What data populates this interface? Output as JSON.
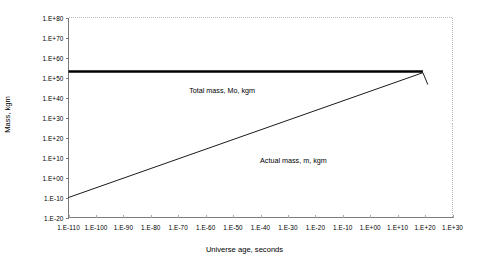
{
  "chart_data": {
    "type": "line",
    "title": "",
    "xlabel": "Universe age, seconds",
    "ylabel": "Mass, kgm",
    "xscale": "log",
    "yscale": "log",
    "xtick_labels": [
      "1.E-110",
      "1.E-100",
      "1.E-90",
      "1.E-80",
      "1.E-70",
      "1.E-60",
      "1.E-50",
      "1.E-40",
      "1.E-30",
      "1.E-20",
      "1.E-10",
      "1.E+00",
      "1.E+10",
      "1.E+20",
      "1.E+30"
    ],
    "xtick_exponents": [
      -110,
      -100,
      -90,
      -80,
      -70,
      -60,
      -50,
      -40,
      -30,
      -20,
      -10,
      0,
      10,
      20,
      30
    ],
    "ytick_labels": [
      "1.E+80",
      "1.E+70",
      "1.E+60",
      "1.E+50",
      "1.E+40",
      "1.E+30",
      "1.E+20",
      "1.E+10",
      "1.E+00",
      "1.E-10",
      "1.E-20"
    ],
    "ytick_exponents": [
      80,
      70,
      60,
      50,
      40,
      30,
      20,
      10,
      0,
      -10,
      -20
    ],
    "xlim_exponents": [
      -110,
      30
    ],
    "ylim_exponents": [
      -20,
      80
    ],
    "grid": false,
    "legend": "none",
    "plot_border": "dotted-light-gray",
    "series": [
      {
        "name": "Total mass, Mo, kgm",
        "style": "thick-solid-black",
        "color": "#000000",
        "points_exponents": [
          [
            -110,
            53
          ],
          [
            19.2,
            53
          ]
        ],
        "annotation": {
          "text": "Total mass, Mo, kgm",
          "x_exponent": -54,
          "y_exponent": 46
        }
      },
      {
        "name": "Actual mass, m, kgm",
        "style": "thin-solid-black",
        "color": "#000000",
        "points_exponents": [
          [
            -110,
            -10
          ],
          [
            19.2,
            52.4
          ],
          [
            21.0,
            46.5
          ]
        ],
        "annotation": {
          "text": "Actual mass, m, kgm",
          "x_exponent": -28,
          "y_exponent": 11
        }
      }
    ]
  }
}
